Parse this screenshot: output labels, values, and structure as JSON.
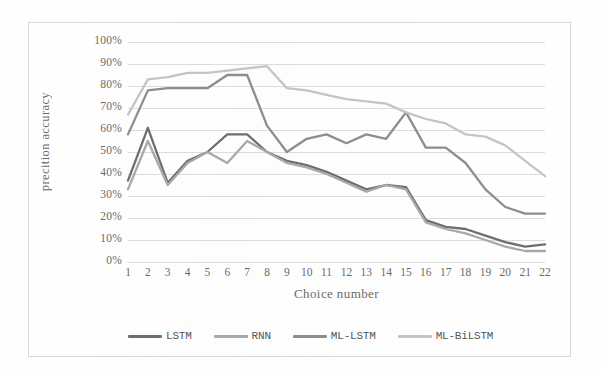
{
  "chart_data": {
    "type": "line",
    "title": "",
    "xlabel": "Choice number",
    "ylabel": "precition accuracy",
    "x": [
      1,
      2,
      3,
      4,
      5,
      6,
      7,
      8,
      9,
      10,
      11,
      12,
      13,
      14,
      15,
      16,
      17,
      18,
      19,
      20,
      21,
      22
    ],
    "xlim": [
      1,
      22
    ],
    "ylim": [
      0,
      100
    ],
    "ytick_labels": [
      "100%",
      "90%",
      "80%",
      "70%",
      "60%",
      "50%",
      "40%",
      "30%",
      "20%",
      "10%",
      "0%"
    ],
    "ytick_values": [
      100,
      90,
      80,
      70,
      60,
      50,
      40,
      30,
      20,
      10,
      0
    ],
    "grid": true,
    "legend_position": "bottom",
    "series": [
      {
        "name": "LSTM",
        "color": "#6e6e6e",
        "values": [
          37,
          61,
          36,
          46,
          50,
          58,
          58,
          50,
          46,
          44,
          41,
          37,
          33,
          35,
          34,
          19,
          16,
          15,
          12,
          9,
          7,
          8
        ]
      },
      {
        "name": "RNN",
        "color": "#a8a8a8",
        "values": [
          33,
          55,
          35,
          45,
          50,
          45,
          55,
          50,
          45,
          43,
          40,
          36,
          32,
          35,
          33,
          18,
          15,
          13,
          10,
          7,
          5,
          5
        ]
      },
      {
        "name": "ML-LSTM",
        "color": "#8d8d8d",
        "values": [
          58,
          78,
          79,
          79,
          79,
          85,
          85,
          62,
          50,
          56,
          58,
          54,
          58,
          56,
          68,
          52,
          52,
          45,
          33,
          25,
          22,
          22
        ]
      },
      {
        "name": "ML-BiLSTM",
        "color": "#c4c4c4",
        "values": [
          67,
          83,
          84,
          86,
          86,
          87,
          88,
          89,
          79,
          78,
          76,
          74,
          73,
          72,
          68,
          65,
          63,
          58,
          57,
          53,
          46,
          39
        ]
      }
    ]
  }
}
